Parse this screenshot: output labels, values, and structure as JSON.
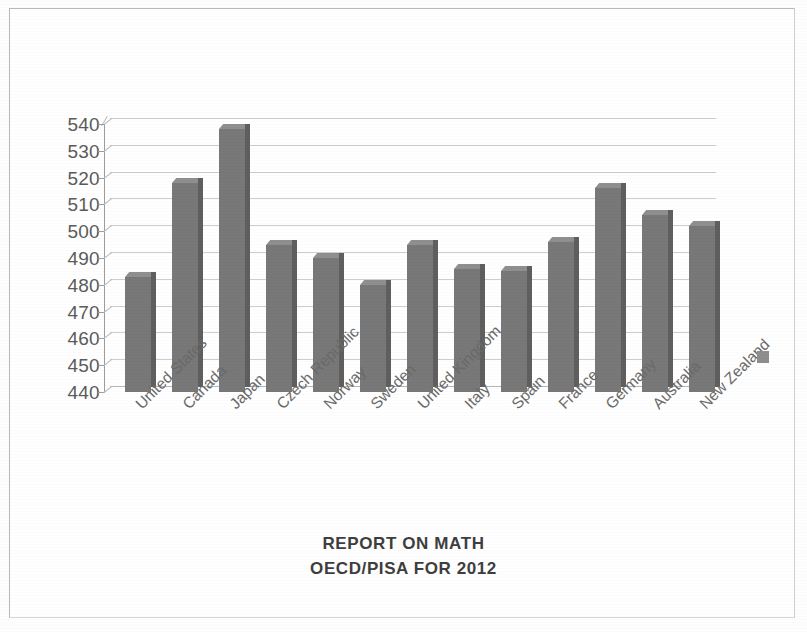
{
  "chart_data": {
    "type": "bar",
    "title": "REPORT ON MATH",
    "subtitle": "OECD/PISA FOR 2012",
    "xlabel": "",
    "ylabel": "",
    "grid": true,
    "legend_position": "right",
    "ylim": [
      440,
      540
    ],
    "ytick_step": 10,
    "ytick_labels": [
      "540",
      "530",
      "520",
      "510",
      "500",
      "490",
      "480",
      "470",
      "460",
      "450",
      "440"
    ],
    "categories": [
      "United States",
      "Canada",
      "Japan",
      "Czech Republic",
      "Norway",
      "Sweden",
      "United Kingdom",
      "Italy",
      "Spain",
      "France",
      "Germany",
      "Australia",
      "New Zealand"
    ],
    "values": [
      483,
      518,
      538,
      495,
      490,
      480,
      495,
      486,
      485,
      496,
      516,
      506,
      502
    ],
    "series": [
      {
        "name": "",
        "values": [
          483,
          518,
          538,
          495,
          490,
          480,
          495,
          486,
          485,
          496,
          516,
          506,
          502
        ]
      }
    ],
    "bar_color": "#787878",
    "gridline_color": "#c4c4c4",
    "axis_color": "#9d9d9d",
    "text_color": "#5b5b5b",
    "title_color": "#3e3e3e",
    "background_color": "#ffffff"
  },
  "legend": {
    "marker_color": "#8e8e8e",
    "label": ""
  },
  "page": {
    "border_color": "#b9b9b9"
  }
}
